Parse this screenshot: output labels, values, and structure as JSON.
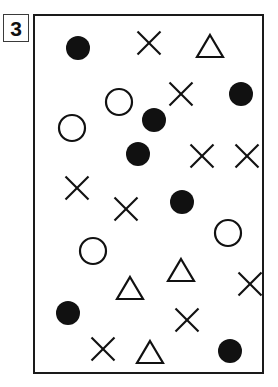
{
  "panel": {
    "label": "3",
    "label_name": "panel-number",
    "frame_color": "#1a1a1a",
    "background_color": "#ffffff",
    "ink_color": "#111111",
    "frame": {
      "x": 33,
      "y": 14,
      "width": 231,
      "height": 360
    }
  },
  "legend": {
    "symbol_kinds": [
      {
        "id": "filled-circle",
        "label": "Filled circle",
        "count": 7
      },
      {
        "id": "open-circle",
        "label": "Open circle",
        "count": 4
      },
      {
        "id": "triangle",
        "label": "Open triangle",
        "count": 4
      },
      {
        "id": "x-mark",
        "label": "X mark",
        "count": 9
      }
    ],
    "total_count": 24
  },
  "chart_data": {
    "type": "scatter",
    "title": "3",
    "xlabel": "",
    "ylabel": "",
    "xlim": [
      0,
      231
    ],
    "ylim": [
      0,
      360
    ],
    "grid": false,
    "legend_position": "none",
    "note": "Coordinates are in panel-local pixels, origin at frame top-left, y increasing downward.",
    "series": [
      {
        "name": "filled-circle",
        "marker": "filled-circle",
        "fill": "#111111",
        "stroke": "#111111",
        "radius": 12,
        "points": [
          {
            "x": 43,
            "y": 32
          },
          {
            "x": 206,
            "y": 78
          },
          {
            "x": 103,
            "y": 138
          },
          {
            "x": 147,
            "y": 186
          },
          {
            "x": 33,
            "y": 297
          },
          {
            "x": 195,
            "y": 335
          },
          {
            "x": 119,
            "y": 104
          }
        ]
      },
      {
        "name": "open-circle",
        "marker": "open-circle",
        "fill": "none",
        "stroke": "#111111",
        "radius": 13,
        "points": [
          {
            "x": 84,
            "y": 86
          },
          {
            "x": 37,
            "y": 112
          },
          {
            "x": 58,
            "y": 235
          },
          {
            "x": 193,
            "y": 217
          }
        ]
      },
      {
        "name": "triangle",
        "marker": "open-triangle",
        "fill": "none",
        "stroke": "#111111",
        "size": 26,
        "points": [
          {
            "x": 175,
            "y": 30
          },
          {
            "x": 95,
            "y": 272
          },
          {
            "x": 146,
            "y": 254
          },
          {
            "x": 115,
            "y": 336
          }
        ]
      },
      {
        "name": "x-mark",
        "marker": "x",
        "fill": "none",
        "stroke": "#111111",
        "size": 23,
        "points": [
          {
            "x": 114,
            "y": 27
          },
          {
            "x": 146,
            "y": 78
          },
          {
            "x": 42,
            "y": 172
          },
          {
            "x": 91,
            "y": 193
          },
          {
            "x": 167,
            "y": 140
          },
          {
            "x": 212,
            "y": 140
          },
          {
            "x": 215,
            "y": 268
          },
          {
            "x": 152,
            "y": 304
          },
          {
            "x": 68,
            "y": 333
          }
        ]
      }
    ]
  }
}
